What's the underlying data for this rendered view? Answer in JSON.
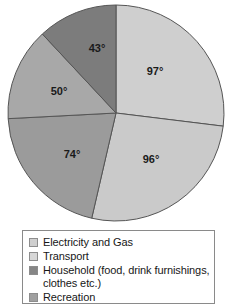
{
  "chart_data": {
    "type": "pie",
    "title": "",
    "units": "degrees",
    "total_degrees": 360,
    "grid": false,
    "legend_position": "bottom",
    "categories": [
      "Electricity and Gas",
      "Transport",
      "Household (food, drink furnishings, clothes etc.)",
      "Recreation"
    ],
    "slices": [
      {
        "index": 0,
        "label": "97°",
        "value": 97,
        "category": "Electricity and Gas",
        "color": "#cfcfcf",
        "start_deg": 0,
        "end_deg": 97,
        "label_x": 155,
        "label_y": 72
      },
      {
        "index": 1,
        "label": "96°",
        "value": 96,
        "category": "Transport",
        "color": "#cacaca",
        "start_deg": 97,
        "end_deg": 193,
        "label_x": 151,
        "label_y": 160
      },
      {
        "index": 2,
        "label": "74°",
        "value": 74,
        "category": "Household (food, drink furnishings, clothes etc.)",
        "color": "#9b9b9b",
        "start_deg": 193,
        "end_deg": 267,
        "label_x": 72,
        "label_y": 155
      },
      {
        "index": 3,
        "label": "50°",
        "value": 50,
        "category": "Recreation",
        "color": "#a8a8a8",
        "start_deg": 267,
        "end_deg": 317,
        "label_x": 59,
        "label_y": 92
      },
      {
        "index": 4,
        "label": "43°",
        "value": 43,
        "category": "",
        "color": "#7c7c7c",
        "start_deg": 317,
        "end_deg": 360,
        "label_x": 97,
        "label_y": 49
      }
    ],
    "geometry": {
      "cx": 116,
      "cy": 113,
      "r": 108,
      "stroke": "#555555",
      "stroke_width": 1
    }
  },
  "legend": {
    "items": [
      {
        "label": "Electricity and Gas",
        "color": "#cfcfcf"
      },
      {
        "label": "Transport",
        "color": "#d7d7d7"
      },
      {
        "label": "Household (food, drink furnishings,\nclothes etc.)",
        "color": "#868686"
      },
      {
        "label": "Recreation",
        "color": "#a0a0a0"
      }
    ]
  }
}
